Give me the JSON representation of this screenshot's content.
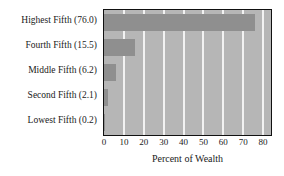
{
  "chart_data": {
    "type": "bar",
    "orientation": "horizontal",
    "title": "",
    "xlabel": "Percent of Wealth",
    "ylabel": "",
    "categories": [
      "Lowest Fifth (0.2)",
      "Second Fifth (2.1)",
      "Middle Fifth (6.2)",
      "Fourth Fifth (15.5)",
      "Highest Fifth (76.0)"
    ],
    "values": [
      0.2,
      2.1,
      6.2,
      15.5,
      76.0
    ],
    "xticks": [
      0,
      10,
      20,
      30,
      40,
      50,
      60,
      70,
      80
    ],
    "xticklabels": [
      "0",
      "10",
      "20",
      "30",
      "40",
      "50",
      "60",
      "70",
      "80"
    ],
    "xlim": [
      0,
      84
    ],
    "grid": "vertical",
    "legend": "none",
    "colors": {
      "bar": "#8f8f8f",
      "plot_background": "#b6b6b6",
      "gridline": "#f2f2f2",
      "axis_border": "#111111",
      "text": "#1a1a1a",
      "figure_background": "#ffffff"
    }
  }
}
